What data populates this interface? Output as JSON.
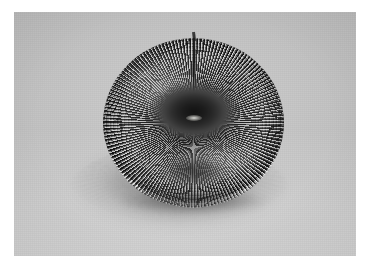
{
  "image": {
    "kind": "photograph",
    "palette": "grayscale",
    "subject": "slinky-coil-spring-torus",
    "description": "A metal slinky coil spring compressed and bent around into a closed torus (donut) shape, resting on a flat light-gray surface.",
    "frame": {
      "border_color": "#ffffff",
      "border_left": 14,
      "border_top": 12,
      "photo_width": 342,
      "photo_height": 244
    },
    "background": {
      "label": "light gray studio surface",
      "color_upper": "#cdcdcd",
      "color_lower": "#dcdcdc"
    },
    "subject_colors": {
      "wire_dark": "#1e1e1e",
      "wire_highlight": "#ebebeb",
      "body_midtone": "#7e7e7e",
      "center_hole": "#121212",
      "shadow": "#5a5a5a"
    },
    "parts": [
      {
        "name": "outer-coil-body",
        "note": "dense radial wire turns forming the donut wall"
      },
      {
        "name": "center-hole",
        "note": "dark converging funnel at the middle of the torus"
      },
      {
        "name": "lower-opening",
        "note": "second, dimmer opening visible below the center"
      },
      {
        "name": "protruding-end-wire",
        "note": "the free end of the spring sticking up at top center"
      },
      {
        "name": "cast-shadow",
        "note": "soft striped shadow fanning downward onto the surface"
      }
    ]
  }
}
